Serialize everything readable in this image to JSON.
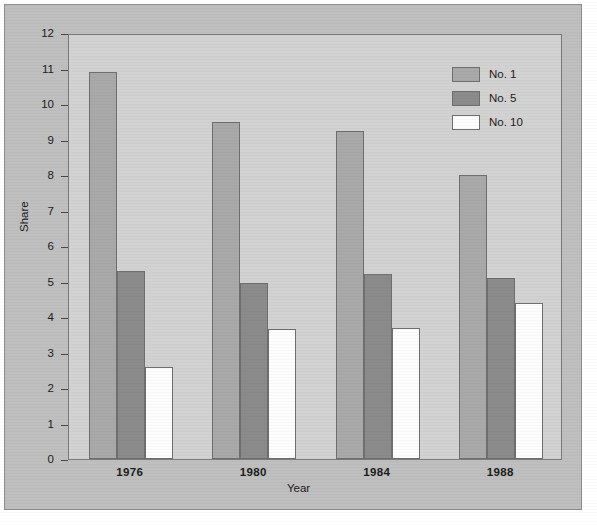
{
  "chart_data": {
    "type": "bar",
    "title": "",
    "xlabel": "Year",
    "ylabel": "Share",
    "categories": [
      "1976",
      "1980",
      "1984",
      "1988"
    ],
    "series": [
      {
        "name": "No. 1",
        "color": "#a9a9a9",
        "values": [
          10.9,
          9.5,
          9.25,
          8.0
        ]
      },
      {
        "name": "No. 5",
        "color": "#8b8b8b",
        "values": [
          5.3,
          4.95,
          5.2,
          5.1
        ]
      },
      {
        "name": "No. 10",
        "color": "#fdfdfd",
        "values": [
          2.6,
          3.65,
          3.7,
          4.4
        ]
      }
    ],
    "ylim": [
      0,
      12
    ],
    "yticks": [
      0,
      1,
      2,
      3,
      4,
      5,
      6,
      7,
      8,
      9,
      10,
      11,
      12
    ],
    "ytick_labels": [
      "0",
      "1",
      "2",
      "3",
      "4",
      "5",
      "6",
      "7",
      "8",
      "9",
      "10",
      "11",
      "12"
    ],
    "grid": false,
    "legend_position": "top-right",
    "plot_background": "#d2d2d2",
    "figure_background": "#bfbfbf",
    "axis_color": "#4a4a4a"
  }
}
